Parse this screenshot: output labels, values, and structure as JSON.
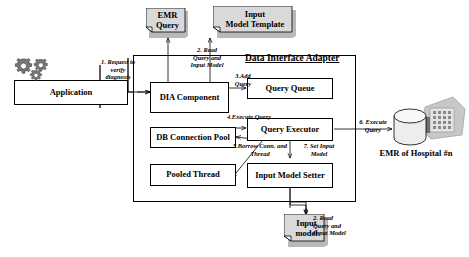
{
  "diagram": {
    "title": "Data Interface Adapter",
    "nodes": {
      "application": "Application",
      "emr_query": "EMR\nQuery",
      "input_model_template": "Input\nModel Template",
      "dia_component": "DIA Component",
      "query_queue": "Query Queue",
      "db_connection_pool": "DB Connection Pool",
      "query_executor": "Query Executor",
      "pooled_thread": "Pooled Thread",
      "input_model_setter": "Input Model Setter",
      "input_model_doc": "Input\nmodel",
      "emr_hospital": "EMR of Hospital #n"
    },
    "edges": {
      "request_verify": "1. Request to\nverify\ndiagnosis",
      "read_query_top": "2. Read\nQuery and\nInput Model",
      "add_query": "3.Add\nQuery",
      "execute_query_internal": "4.Execute Query",
      "borrow_conn_thread": "5.Borrow Conn. and\nThread",
      "execute_query_external": "6. Execute\nQuery",
      "set_input_model": "7. Set Input\nModel",
      "read_query_bottom": "2. Read\nQuery and\nInput Model"
    },
    "icons": {
      "gears": "gears-icon",
      "database": "database-cylinder-icon",
      "building": "hospital-building-icon"
    },
    "colors": {
      "stroke": "#000000",
      "doc_fill": "#d9d9d9",
      "icon_gray": "#b0b0b0",
      "background": "#ffffff"
    }
  }
}
